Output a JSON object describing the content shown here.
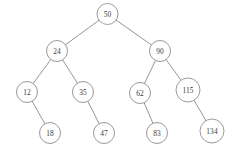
{
  "figure": {
    "width": 244,
    "height": 157,
    "background_color": "#ffffff",
    "node_fill_color": "#ffffff",
    "node_stroke_color": "#8f8f8f",
    "edge_color": "#8a8a8a",
    "label_color": "#3b3b3b"
  },
  "chart_data": {
    "type": "diagram",
    "diagram_kind": "binary-search-tree",
    "title": "",
    "nodes": [
      {
        "id": "n50",
        "label": "50",
        "x": 107.5,
        "y": 14,
        "r": 10.5,
        "level": 0
      },
      {
        "id": "n24",
        "label": "24",
        "x": 57,
        "y": 51,
        "r": 10.5,
        "level": 1
      },
      {
        "id": "n90",
        "label": "90",
        "x": 160,
        "y": 51,
        "r": 10.5,
        "level": 1
      },
      {
        "id": "n12",
        "label": "12",
        "x": 27,
        "y": 92,
        "r": 10.5,
        "level": 2
      },
      {
        "id": "n35",
        "label": "35",
        "x": 83,
        "y": 92,
        "r": 10.5,
        "level": 2
      },
      {
        "id": "n62",
        "label": "62",
        "x": 140,
        "y": 93,
        "r": 10.5,
        "level": 2
      },
      {
        "id": "n115",
        "label": "115",
        "x": 188,
        "y": 90,
        "r": 12,
        "level": 2
      },
      {
        "id": "n18",
        "label": "18",
        "x": 50,
        "y": 133,
        "r": 10.5,
        "level": 3
      },
      {
        "id": "n47",
        "label": "47",
        "x": 104,
        "y": 133,
        "r": 10.5,
        "level": 3
      },
      {
        "id": "n83",
        "label": "83",
        "x": 157,
        "y": 133,
        "r": 10.5,
        "level": 3
      },
      {
        "id": "n134",
        "label": "134",
        "x": 212,
        "y": 131,
        "r": 12,
        "level": 3
      }
    ],
    "edges": [
      {
        "from": "n50",
        "to": "n24",
        "side": "left"
      },
      {
        "from": "n50",
        "to": "n90",
        "side": "right"
      },
      {
        "from": "n24",
        "to": "n12",
        "side": "left"
      },
      {
        "from": "n24",
        "to": "n35",
        "side": "right"
      },
      {
        "from": "n90",
        "to": "n62",
        "side": "left"
      },
      {
        "from": "n90",
        "to": "n115",
        "side": "right"
      },
      {
        "from": "n12",
        "to": "n18",
        "side": "right"
      },
      {
        "from": "n35",
        "to": "n47",
        "side": "right"
      },
      {
        "from": "n62",
        "to": "n83",
        "side": "right"
      },
      {
        "from": "n115",
        "to": "n134",
        "side": "right"
      }
    ],
    "values": [
      50,
      24,
      90,
      12,
      35,
      62,
      115,
      18,
      47,
      83,
      134
    ],
    "root": "50",
    "depth": 4,
    "node_count": 11
  }
}
